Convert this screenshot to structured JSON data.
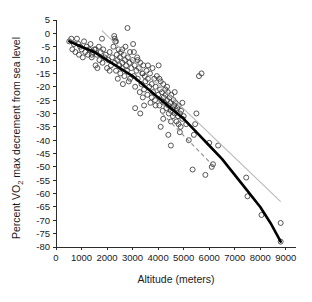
{
  "chart_data": {
    "type": "scatter",
    "title": "",
    "xlabel": "Altitude (meters)",
    "ylabel": "Percent VO2 max decrement from sea level",
    "ylabel_parts": {
      "pre": "Percent VO",
      "sub": "2",
      "post": " max decrement from sea level"
    },
    "xlim": [
      0,
      9400
    ],
    "ylim": [
      -80,
      5
    ],
    "grid": false,
    "legend": "none",
    "xticks": [
      0,
      1000,
      2000,
      3000,
      4000,
      5000,
      6000,
      7000,
      8000,
      9000
    ],
    "xtick_labels": [
      "0",
      "1000",
      "2000",
      "3000",
      "4000",
      "5000",
      "6000",
      "7000",
      "8000",
      "9000"
    ],
    "yticks": [
      5,
      0,
      -5,
      -10,
      -15,
      -20,
      -25,
      -30,
      -35,
      -40,
      -45,
      -50,
      -55,
      -60,
      -65,
      -70,
      -75,
      -80
    ],
    "ytick_labels": [
      "5",
      "0",
      "-5",
      "-10",
      "-15",
      "-20",
      "-25",
      "-30",
      "-35",
      "-40",
      "-45",
      "-50",
      "-55",
      "-60",
      "-65",
      "-70",
      "-75",
      "-80"
    ],
    "marker": "open-circle",
    "marker_color": "#3a3a3a",
    "points": [
      [
        520,
        -3
      ],
      [
        600,
        -2
      ],
      [
        640,
        -6
      ],
      [
        700,
        -4
      ],
      [
        760,
        -7
      ],
      [
        820,
        -2
      ],
      [
        880,
        -4
      ],
      [
        900,
        -8
      ],
      [
        950,
        -5
      ],
      [
        1000,
        -6
      ],
      [
        1050,
        -9
      ],
      [
        1100,
        -3
      ],
      [
        1150,
        -7
      ],
      [
        1200,
        -5
      ],
      [
        1250,
        -8
      ],
      [
        1300,
        -6
      ],
      [
        1350,
        -4
      ],
      [
        1400,
        -9
      ],
      [
        1450,
        -7
      ],
      [
        1500,
        -6
      ],
      [
        1550,
        -12
      ],
      [
        1600,
        -8
      ],
      [
        1620,
        -13
      ],
      [
        1680,
        -5
      ],
      [
        1700,
        -10
      ],
      [
        1750,
        -7
      ],
      [
        1800,
        -2
      ],
      [
        1820,
        -11
      ],
      [
        1850,
        -6
      ],
      [
        1900,
        -9
      ],
      [
        1950,
        -8
      ],
      [
        2000,
        -13
      ],
      [
        2050,
        -10
      ],
      [
        2100,
        -7
      ],
      [
        2150,
        -12
      ],
      [
        2200,
        -9
      ],
      [
        2250,
        -5
      ],
      [
        2280,
        -1
      ],
      [
        2300,
        -11
      ],
      [
        2320,
        -3
      ],
      [
        2350,
        -14
      ],
      [
        2380,
        -8
      ],
      [
        2400,
        -10
      ],
      [
        2420,
        -17
      ],
      [
        2450,
        -6
      ],
      [
        2480,
        -12
      ],
      [
        2500,
        -9
      ],
      [
        2520,
        -15
      ],
      [
        2550,
        -7
      ],
      [
        2580,
        -13
      ],
      [
        2600,
        -11
      ],
      [
        2620,
        -19
      ],
      [
        2650,
        -8
      ],
      [
        2680,
        -16
      ],
      [
        2700,
        -10
      ],
      [
        2720,
        -5
      ],
      [
        2750,
        -12
      ],
      [
        2780,
        -14
      ],
      [
        2800,
        2
      ],
      [
        2820,
        -9
      ],
      [
        2850,
        -18
      ],
      [
        2880,
        -11
      ],
      [
        2900,
        -7
      ],
      [
        2950,
        -13
      ],
      [
        3000,
        -10
      ],
      [
        3020,
        -4
      ],
      [
        3050,
        -16
      ],
      [
        3080,
        -12
      ],
      [
        3100,
        -20
      ],
      [
        3150,
        -14
      ],
      [
        3180,
        -9
      ],
      [
        3200,
        -17
      ],
      [
        3250,
        -13
      ],
      [
        3280,
        -22
      ],
      [
        3300,
        -11
      ],
      [
        3350,
        -19
      ],
      [
        3380,
        -15
      ],
      [
        3400,
        -24
      ],
      [
        3420,
        -12
      ],
      [
        3450,
        -21
      ],
      [
        3480,
        -16
      ],
      [
        3500,
        -18
      ],
      [
        3550,
        -14
      ],
      [
        3580,
        -23
      ],
      [
        3600,
        -17
      ],
      [
        3650,
        -20
      ],
      [
        3680,
        -15
      ],
      [
        3700,
        -26
      ],
      [
        3750,
        -19
      ],
      [
        3780,
        -13
      ],
      [
        3800,
        -22
      ],
      [
        3850,
        -17
      ],
      [
        3880,
        -25
      ],
      [
        3900,
        -20
      ],
      [
        3950,
        -16
      ],
      [
        4000,
        -23
      ],
      [
        4020,
        -12
      ],
      [
        4050,
        -27
      ],
      [
        4080,
        -21
      ],
      [
        4100,
        -18
      ],
      [
        4120,
        -25
      ],
      [
        4150,
        -22
      ],
      [
        4180,
        -29
      ],
      [
        4200,
        -19
      ],
      [
        4220,
        -24
      ],
      [
        4250,
        -26
      ],
      [
        4280,
        -21
      ],
      [
        4300,
        -23
      ],
      [
        4320,
        -28
      ],
      [
        4350,
        -25
      ],
      [
        4380,
        -22
      ],
      [
        4400,
        -27
      ],
      [
        4420,
        -30
      ],
      [
        4450,
        -24
      ],
      [
        4480,
        -26
      ],
      [
        4500,
        -29
      ],
      [
        4520,
        -23
      ],
      [
        4550,
        -28
      ],
      [
        4580,
        -31
      ],
      [
        4600,
        -25
      ],
      [
        4620,
        -27
      ],
      [
        4650,
        -30
      ],
      [
        4680,
        -26
      ],
      [
        4700,
        -29
      ],
      [
        4720,
        -33
      ],
      [
        4750,
        -28
      ],
      [
        4780,
        -31
      ],
      [
        4800,
        -27
      ],
      [
        4850,
        -30
      ],
      [
        4880,
        -35
      ],
      [
        4900,
        -29
      ],
      [
        4950,
        -32
      ],
      [
        3100,
        -28
      ],
      [
        3300,
        -30
      ],
      [
        3450,
        -27
      ],
      [
        4100,
        -35
      ],
      [
        4400,
        -38
      ],
      [
        4500,
        -42
      ],
      [
        4850,
        -37
      ],
      [
        5000,
        -31
      ],
      [
        5100,
        -34
      ],
      [
        5200,
        -40
      ],
      [
        5350,
        -51
      ],
      [
        5400,
        -38
      ],
      [
        5450,
        -34
      ],
      [
        5500,
        -30
      ],
      [
        5600,
        -16
      ],
      [
        5700,
        -15
      ],
      [
        5850,
        -53
      ],
      [
        6000,
        -41
      ],
      [
        6100,
        -50
      ],
      [
        6150,
        -49
      ],
      [
        6350,
        -42
      ],
      [
        7450,
        -54
      ],
      [
        7500,
        -61
      ],
      [
        8050,
        -68
      ],
      [
        8800,
        -71
      ],
      [
        8800,
        -78
      ],
      [
        1400,
        -8
      ],
      [
        1550,
        -6
      ],
      [
        2100,
        -14
      ],
      [
        2300,
        -2
      ],
      [
        2350,
        -3
      ],
      [
        2600,
        -6
      ],
      [
        2900,
        -17
      ],
      [
        3050,
        -7
      ],
      [
        3200,
        -10
      ],
      [
        3400,
        -15
      ],
      [
        3600,
        -12
      ],
      [
        3750,
        -24
      ],
      [
        3900,
        -27
      ],
      [
        4050,
        -17
      ],
      [
        4200,
        -32
      ],
      [
        4350,
        -20
      ],
      [
        4500,
        -33
      ],
      [
        4650,
        -22
      ],
      [
        4800,
        -34
      ],
      [
        4950,
        -26
      ]
    ],
    "fits": [
      {
        "name": "polynomial-fit-thick",
        "style": "solid-thick",
        "color": "#000000",
        "points": [
          [
            520,
            -3
          ],
          [
            1000,
            -5
          ],
          [
            1500,
            -7
          ],
          [
            2000,
            -10
          ],
          [
            2500,
            -13
          ],
          [
            3000,
            -16
          ],
          [
            3500,
            -20
          ],
          [
            4000,
            -24
          ],
          [
            4500,
            -28
          ],
          [
            5000,
            -32
          ],
          [
            5500,
            -37
          ],
          [
            6000,
            -42
          ],
          [
            6500,
            -47
          ],
          [
            7000,
            -53
          ],
          [
            7500,
            -59
          ],
          [
            8000,
            -65
          ],
          [
            8400,
            -71
          ],
          [
            8800,
            -78
          ]
        ]
      },
      {
        "name": "linear-fit-gray",
        "style": "solid-thin",
        "color": "#b9b9b9",
        "points": [
          [
            1800,
            1
          ],
          [
            8800,
            -63
          ]
        ]
      },
      {
        "name": "linear-fit-dashed",
        "style": "dashed",
        "color": "#8e8e8e",
        "points": [
          [
            4150,
            -30
          ],
          [
            6200,
            -50
          ]
        ]
      }
    ]
  }
}
